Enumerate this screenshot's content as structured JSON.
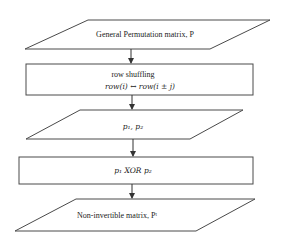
{
  "diagram": {
    "type": "flowchart",
    "nodes": [
      {
        "id": "n1",
        "shape": "parallelogram",
        "label": "General Permutation matrix, P"
      },
      {
        "id": "n2",
        "shape": "rectangle",
        "label": "row shuffling",
        "sublabel": "row(i) ↔ row(i ± j)"
      },
      {
        "id": "n3",
        "shape": "parallelogram",
        "label": "p₁, p₂"
      },
      {
        "id": "n4",
        "shape": "rectangle",
        "label": "p₁ XOR p₂"
      },
      {
        "id": "n5",
        "shape": "parallelogram",
        "label": "Non-invertible matrix, Pᵗ"
      }
    ],
    "edges": [
      {
        "from": "n1",
        "to": "n2"
      },
      {
        "from": "n2",
        "to": "n3"
      },
      {
        "from": "n3",
        "to": "n4"
      },
      {
        "from": "n4",
        "to": "n5"
      }
    ]
  },
  "colors": {
    "stroke": "#4a4a4a",
    "background": "#ffffff",
    "text": "#222222"
  }
}
